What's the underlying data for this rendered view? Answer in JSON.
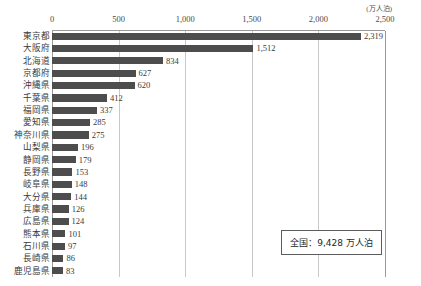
{
  "chart_data": {
    "type": "bar",
    "orientation": "horizontal",
    "title": "",
    "xlabel": "",
    "ylabel": "",
    "unit_label": "(万人泊)",
    "xlim": [
      0,
      2500
    ],
    "xticks": [
      "0",
      "500",
      "1,000",
      "1,500",
      "2,000",
      "2,500"
    ],
    "xtick_values": [
      0,
      500,
      1000,
      1500,
      2000,
      2500
    ],
    "grid": "vertical",
    "legend": "none",
    "categories": [
      "東京都",
      "大阪府",
      "北海道",
      "京都府",
      "沖縄県",
      "千葉県",
      "福岡県",
      "愛知県",
      "神奈川県",
      "山梨県",
      "静岡県",
      "長野県",
      "岐阜県",
      "大分県",
      "兵庫県",
      "広島県",
      "熊本県",
      "石川県",
      "長崎県",
      "鹿児島県"
    ],
    "values": [
      2319,
      1512,
      834,
      627,
      620,
      412,
      337,
      285,
      275,
      196,
      179,
      153,
      148,
      144,
      126,
      124,
      101,
      97,
      86,
      83
    ],
    "value_labels": [
      "2,319",
      "1,512",
      "834",
      "627",
      "620",
      "412",
      "337",
      "285",
      "275",
      "196",
      "179",
      "153",
      "148",
      "144",
      "126",
      "124",
      "101",
      "97",
      "86",
      "83"
    ],
    "bar_color": "#4d4d4d",
    "annotation": "全国：9,428 万人泊"
  }
}
